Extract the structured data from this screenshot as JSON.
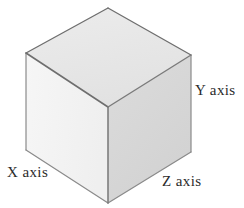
{
  "figure": {
    "background_color": "#ffffff",
    "width": 244,
    "height": 208
  },
  "cube": {
    "faces": [
      {
        "id": "top-face",
        "name": "top-face",
        "fill": "#e9e9e9",
        "points": "108,8 191,55 108,107 26,53"
      },
      {
        "id": "left-face",
        "name": "left-face",
        "fill": "#f3f3f3",
        "points": "26,53 108,107 108,203 26,150"
      },
      {
        "id": "right-face",
        "name": "right-face",
        "fill": "#d7d7d7",
        "points": "108,107 191,55 191,152 108,203"
      }
    ],
    "edges": [
      {
        "id": "edge-top-left",
        "x1": 26,
        "y1": 53,
        "x2": 108,
        "y2": 8,
        "color": "#6e6e6e",
        "width": 1.3
      },
      {
        "id": "edge-top-right",
        "x1": 108,
        "y1": 8,
        "x2": 191,
        "y2": 55,
        "color": "#6e6e6e",
        "width": 1.3
      },
      {
        "id": "edge-top-inner-left",
        "x1": 26,
        "y1": 53,
        "x2": 108,
        "y2": 107,
        "color": "#6e6e6e",
        "width": 1.6
      },
      {
        "id": "edge-top-inner-right",
        "x1": 108,
        "y1": 107,
        "x2": 191,
        "y2": 55,
        "color": "#7a7a7a",
        "width": 1.4
      },
      {
        "id": "edge-vertical-center",
        "x1": 108,
        "y1": 107,
        "x2": 108,
        "y2": 203,
        "color": "#7d7d7d",
        "width": 1.6
      },
      {
        "id": "edge-vertical-left",
        "x1": 26,
        "y1": 53,
        "x2": 26,
        "y2": 150,
        "color": "#8a8a8a",
        "width": 1.2
      },
      {
        "id": "edge-vertical-right",
        "x1": 191,
        "y1": 55,
        "x2": 191,
        "y2": 152,
        "color": "#8a8a8a",
        "width": 1.2
      },
      {
        "id": "edge-bottom-left",
        "x1": 26,
        "y1": 150,
        "x2": 108,
        "y2": 203,
        "color": "#8a8a8a",
        "width": 1.2
      },
      {
        "id": "edge-bottom-right",
        "x1": 108,
        "y1": 203,
        "x2": 191,
        "y2": 152,
        "color": "#8a8a8a",
        "width": 1.2
      }
    ],
    "vertices": {
      "top_apex": [
        108,
        8
      ],
      "top_left": [
        26,
        53
      ],
      "top_right": [
        191,
        55
      ],
      "center": [
        108,
        107
      ],
      "bottom_left": [
        26,
        150
      ],
      "bottom_center": [
        108,
        203
      ],
      "bottom_right": [
        191,
        152
      ]
    }
  },
  "labels": {
    "x_axis": "X axis",
    "y_axis": "Y axis",
    "z_axis": "Z axis"
  }
}
